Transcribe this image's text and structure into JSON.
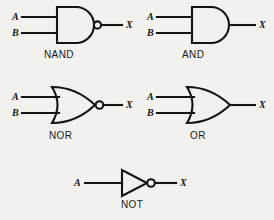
{
  "figure": {
    "background_color": "#f2f1ed",
    "line_color": "#141414"
  },
  "labels": {
    "input_a": "A",
    "input_b": "B",
    "output_x": "X"
  },
  "gates": [
    {
      "id": "nand",
      "name": "NAND",
      "shape": "and-body",
      "inverted": true,
      "inputs": [
        "A",
        "B"
      ],
      "output": "X"
    },
    {
      "id": "and",
      "name": "AND",
      "shape": "and-body",
      "inverted": false,
      "inputs": [
        "A",
        "B"
      ],
      "output": "X"
    },
    {
      "id": "nor",
      "name": "NOR",
      "shape": "or-body",
      "inverted": true,
      "inputs": [
        "A",
        "B"
      ],
      "output": "X"
    },
    {
      "id": "or",
      "name": "OR",
      "shape": "or-body",
      "inverted": false,
      "inputs": [
        "A",
        "B"
      ],
      "output": "X"
    },
    {
      "id": "not",
      "name": "NOT",
      "shape": "triangle-body",
      "inverted": true,
      "inputs": [
        "A"
      ],
      "output": "X"
    }
  ]
}
